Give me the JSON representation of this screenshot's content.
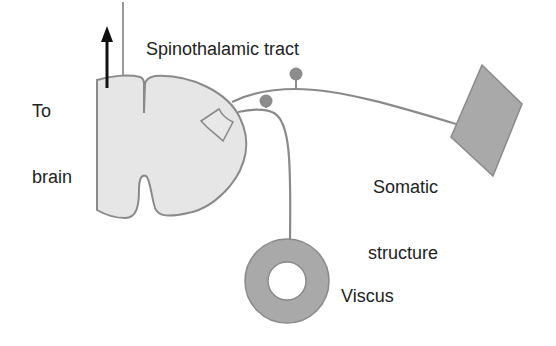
{
  "labels": {
    "to_brain_line1": "To",
    "to_brain_line2": "brain",
    "tract": "Spinothalamic tract",
    "somatic_line1": "Somatic",
    "somatic_line2": "structure",
    "viscus": "Viscus"
  },
  "colors": {
    "cord_fill": "#e6e6e6",
    "outline": "#8a8a8a",
    "organ_fill": "#a9a9a9",
    "knob_fill": "#8c8c8c",
    "arrow": "#111111"
  }
}
